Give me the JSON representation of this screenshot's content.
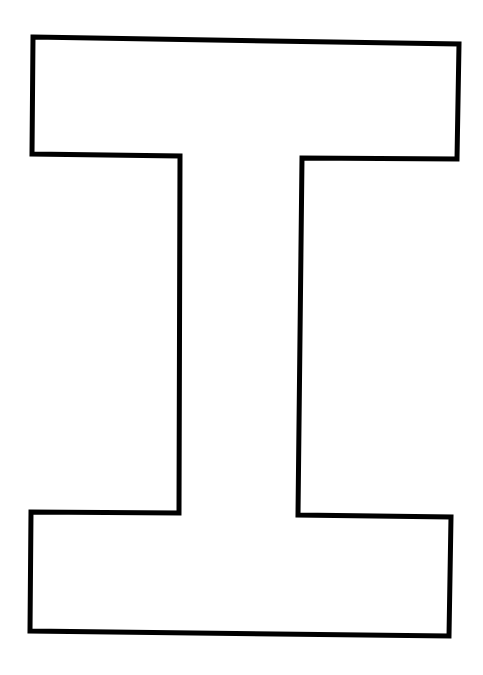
{
  "page": {
    "background_color": "#ffffff"
  },
  "graphic": {
    "type": "letter-outline",
    "letter": "I",
    "stroke_color": "#000000",
    "fill_color": "#ffffff",
    "stroke_width": 5,
    "outline_points": "33,37 459,44 457,159 302,158 298,515 451,517 449,636 30,631 31,512 179,513 180,156 32,154"
  }
}
